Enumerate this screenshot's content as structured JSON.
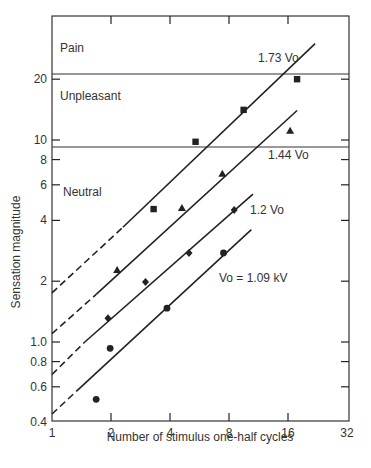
{
  "chart_data": {
    "type": "scatter",
    "title": "",
    "xlabel": "Number of stimulus one-half cycles",
    "ylabel": "Sensation magnitude",
    "xscale": "log2",
    "yscale": "log10",
    "xlim": [
      1,
      32
    ],
    "ylim": [
      0.4,
      30
    ],
    "x_ticks": [
      1,
      2,
      4,
      8,
      16,
      32
    ],
    "x_tick_labels": [
      "1",
      "2",
      "4",
      "8",
      "16",
      "32"
    ],
    "y_ticks": [
      0.4,
      0.6,
      0.8,
      1.0,
      2,
      4,
      6,
      8,
      10,
      20
    ],
    "y_tick_labels": [
      "0.4",
      "0.6",
      "0.8",
      "1.0",
      "2",
      "4",
      "6",
      "8",
      "10",
      "20"
    ],
    "grid": false,
    "regions": [
      {
        "label": "Pain",
        "above": 21
      },
      {
        "label": "Unpleasant",
        "from": 9.2,
        "to": 21
      },
      {
        "label": "Neutral",
        "below": 9.2
      }
    ],
    "series": [
      {
        "name": "1.73 Vo",
        "marker": "square",
        "points": [
          [
            3.3,
            4.55
          ],
          [
            5.4,
            9.8
          ],
          [
            9.5,
            14.1
          ],
          [
            17.8,
            20.0
          ]
        ],
        "fit_line": {
          "dashed_from": [
            1,
            1.75
          ],
          "solid_from": [
            2.3,
            3.7
          ],
          "solid_to": [
            22,
            30
          ]
        }
      },
      {
        "name": "1.44 Vo",
        "marker": "triangle",
        "points": [
          [
            2.15,
            2.27
          ],
          [
            4.6,
            4.6
          ],
          [
            7.4,
            6.8
          ],
          [
            16.4,
            11.1
          ]
        ],
        "fit_line": {
          "dashed_from": [
            1,
            1.1
          ],
          "solid_from": [
            1.68,
            1.72
          ],
          "solid_to": [
            17.8,
            14.0
          ]
        }
      },
      {
        "name": "1.2 Vo",
        "marker": "diamond",
        "points": [
          [
            1.93,
            1.31
          ],
          [
            3.0,
            1.98
          ],
          [
            5.0,
            2.76
          ],
          [
            8.5,
            4.5
          ]
        ],
        "fit_line": {
          "dashed_from": [
            1,
            0.69
          ],
          "solid_from": [
            1.47,
            1.0
          ],
          "solid_to": [
            10.6,
            5.4
          ]
        }
      },
      {
        "name": "Vo = 1.09 kV",
        "marker": "circle",
        "points": [
          [
            1.68,
            0.52
          ],
          [
            1.98,
            0.93
          ],
          [
            3.86,
            1.47
          ],
          [
            7.5,
            2.76
          ]
        ],
        "fit_line": {
          "dashed_from": [
            1,
            0.44
          ],
          "solid_from": [
            1.33,
            0.57
          ],
          "solid_to": [
            10.4,
            3.6
          ]
        }
      }
    ],
    "annotations": [
      {
        "text": "Pain"
      },
      {
        "text": "Unpleasant"
      },
      {
        "text": "Neutral"
      },
      {
        "text": "1.73 Vo"
      },
      {
        "text": "1.44 Vo"
      },
      {
        "text": "1.2 Vo"
      },
      {
        "text": "Vo = 1.09 kV"
      }
    ]
  },
  "labels": {
    "xlabel": "Number of stimulus one-half cycles",
    "ylabel": "Sensation magnitude",
    "region_pain": "Pain",
    "region_unpleasant": "Unpleasant",
    "region_neutral": "Neutral",
    "line_173": "1.73 Vo",
    "line_144": "1.44 Vo",
    "line_12": "1.2 Vo",
    "line_vo": "Vo = 1.09 kV"
  },
  "colors": {
    "ink": "#222222",
    "background": "#ffffff"
  }
}
